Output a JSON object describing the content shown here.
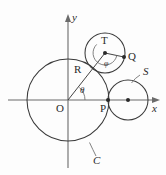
{
  "figure": {
    "background_color": "#fdfdfd",
    "stroke_color": "#3a3a3a",
    "axis_color": "#6b6b6b",
    "label_color": "#2a2a2a"
  },
  "axes": {
    "x_label": "x",
    "y_label": "y",
    "origin_label": "O",
    "x_axis_y": 100,
    "y_axis_x": 68,
    "x_range": [
      8,
      160
    ],
    "y_range": [
      14,
      168
    ]
  },
  "points": [
    {
      "name": "O",
      "label": "O",
      "x": 68,
      "y": 100,
      "dot": false
    },
    {
      "name": "P",
      "label": "P",
      "x": 108,
      "y": 100,
      "dot": true
    },
    {
      "name": "R",
      "label": "R",
      "x": 85,
      "y": 78,
      "dot": false
    },
    {
      "name": "T",
      "label": "T",
      "x": 105,
      "y": 53,
      "dot": true
    },
    {
      "name": "Q",
      "label": "Q",
      "x": 124,
      "y": 57,
      "dot": true
    },
    {
      "name": "S-center",
      "label": "",
      "x": 128,
      "y": 100,
      "dot": true
    }
  ],
  "circles": [
    {
      "name": "C",
      "label": "C",
      "cx": 68,
      "cy": 100,
      "r": 41
    },
    {
      "name": "S",
      "label": "S",
      "cx": 128,
      "cy": 100,
      "r": 20
    },
    {
      "name": "T",
      "label": "",
      "cx": 105,
      "cy": 53,
      "r": 20
    }
  ],
  "angles": [
    {
      "name": "theta",
      "label": "θ",
      "vertex": "O",
      "value_deg": 48
    },
    {
      "name": "phi",
      "label": "φ",
      "vertex": "T",
      "value_deg": 200
    }
  ],
  "labels": {
    "y_axis": "y",
    "x_axis": "x",
    "origin": "O",
    "point_P": "P",
    "point_R": "R",
    "point_T": "T",
    "point_Q": "Q",
    "circle_S": "S",
    "circle_C": "C",
    "angle_theta": "θ",
    "angle_phi": "φ"
  },
  "leaders": [
    {
      "name": "leader-S",
      "from_label": "S",
      "x1": 141,
      "y1": 75,
      "x2": 132,
      "y2": 82
    },
    {
      "name": "leader-C",
      "from_label": "C",
      "x1": 97,
      "y1": 158,
      "x2": 90,
      "y2": 142
    }
  ],
  "segments": [
    {
      "name": "OT-radius-line",
      "x1": 68,
      "y1": 100,
      "x2": 105,
      "y2": 53
    },
    {
      "name": "TQ-radius-line",
      "x1": 105,
      "y1": 53,
      "x2": 124,
      "y2": 57
    }
  ]
}
